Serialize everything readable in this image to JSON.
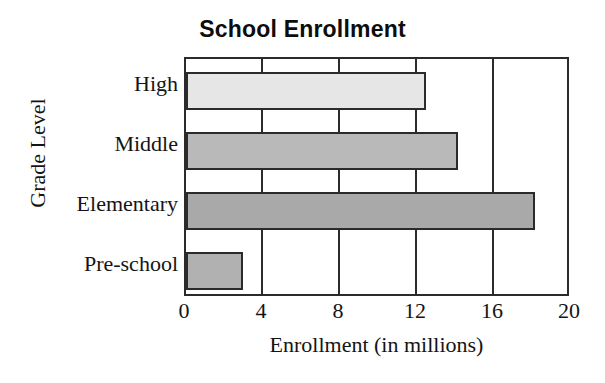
{
  "chart_data": {
    "type": "bar",
    "orientation": "horizontal",
    "title": "School Enrollment",
    "xlabel": "Enrollment (in millions)",
    "ylabel": "Grade Level",
    "categories": [
      "Pre-school",
      "Elementary",
      "Middle",
      "High"
    ],
    "values": [
      3,
      18.3,
      14.3,
      12.6
    ],
    "xlim": [
      0,
      20
    ],
    "xticks": [
      0,
      4,
      8,
      12,
      16,
      20
    ],
    "xtick_labels": [
      "0",
      "4",
      "8",
      "12",
      "16",
      "20"
    ],
    "grid": "vertical",
    "legend": "none",
    "bars": [
      {
        "category": "High",
        "value": 12.6,
        "color": "#e6e6e6"
      },
      {
        "category": "Middle",
        "value": 14.3,
        "color": "#b9b9b9"
      },
      {
        "category": "Elementary",
        "value": 18.3,
        "color": "#a9a9a9"
      },
      {
        "category": "Pre-school",
        "value": 3.0,
        "color": "#b1b1b1"
      }
    ],
    "colors": {
      "axis": "#2b2b2b",
      "text": "#141414",
      "background": "#ffffff"
    }
  }
}
